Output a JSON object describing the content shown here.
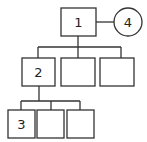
{
  "diagram": {
    "type": "tree",
    "nodes": [
      {
        "id": "n1",
        "label": "1",
        "shape": "rect",
        "x": 61,
        "y": 8,
        "w": 35,
        "h": 28
      },
      {
        "id": "n4",
        "label": "4",
        "shape": "circle",
        "cx": 128,
        "cy": 22,
        "r": 14
      },
      {
        "id": "n2",
        "label": "2",
        "shape": "rect",
        "x": 22,
        "y": 58,
        "w": 33,
        "h": 28
      },
      {
        "id": "n5",
        "label": "",
        "shape": "rect",
        "x": 61,
        "y": 58,
        "w": 34,
        "h": 28
      },
      {
        "id": "n6",
        "label": "",
        "shape": "rect",
        "x": 100,
        "y": 58,
        "w": 34,
        "h": 28
      },
      {
        "id": "n3",
        "label": "3",
        "shape": "rect",
        "x": 8,
        "y": 110,
        "w": 27,
        "h": 28
      },
      {
        "id": "n7",
        "label": "",
        "shape": "rect",
        "x": 37,
        "y": 110,
        "w": 27,
        "h": 28
      },
      {
        "id": "n8",
        "label": "",
        "shape": "rect",
        "x": 67,
        "y": 110,
        "w": 27,
        "h": 28
      }
    ],
    "edges": [
      {
        "from": "n1",
        "to": "n4"
      },
      {
        "from": "n1",
        "to": "n2"
      },
      {
        "from": "n1",
        "to": "n5"
      },
      {
        "from": "n1",
        "to": "n6"
      },
      {
        "from": "n2",
        "to": "n3"
      },
      {
        "from": "n2",
        "to": "n7"
      },
      {
        "from": "n2",
        "to": "n8"
      }
    ],
    "labels": {
      "n1": "1",
      "n2": "2",
      "n3": "3",
      "n4": "4"
    }
  }
}
